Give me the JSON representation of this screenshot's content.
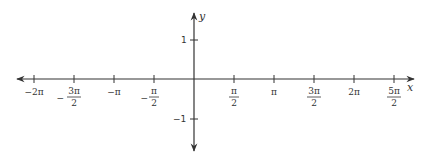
{
  "diagram": {
    "type": "coordinate-axes",
    "colors": {
      "axis": "#333333",
      "text": "#333333",
      "background": "#ffffff"
    },
    "x_axis": {
      "name": "x",
      "ticks": [
        {
          "value": "-2pi",
          "sign": "−",
          "num": "2π",
          "den": ""
        },
        {
          "value": "-3pi/2",
          "sign": "−",
          "num": "3π",
          "den": "2"
        },
        {
          "value": "-pi",
          "sign": "−",
          "num": "π",
          "den": ""
        },
        {
          "value": "-pi/2",
          "sign": "−",
          "num": "π",
          "den": "2"
        },
        {
          "value": "pi/2",
          "sign": "",
          "num": "π",
          "den": "2"
        },
        {
          "value": "pi",
          "sign": "",
          "num": "π",
          "den": ""
        },
        {
          "value": "3pi/2",
          "sign": "",
          "num": "3π",
          "den": "2"
        },
        {
          "value": "2pi",
          "sign": "",
          "num": "2π",
          "den": ""
        },
        {
          "value": "5pi/2",
          "sign": "",
          "num": "5π",
          "den": "2"
        }
      ]
    },
    "y_axis": {
      "name": "y",
      "ticks": [
        {
          "value": 1,
          "label": "1"
        },
        {
          "value": -1,
          "label": "−1"
        }
      ]
    },
    "labels": {
      "x_name": "x",
      "y_name": "y",
      "t_m2pi": "−2π",
      "t_m3pi2_sign": "−",
      "t_m3pi2_num": "3π",
      "t_m3pi2_den": "2",
      "t_mpi": "−π",
      "t_mpi2_sign": "−",
      "t_mpi2_num": "π",
      "t_mpi2_den": "2",
      "t_pi2_num": "π",
      "t_pi2_den": "2",
      "t_pi": "π",
      "t_3pi2_num": "3π",
      "t_3pi2_den": "2",
      "t_2pi": "2π",
      "t_5pi2_num": "5π",
      "t_5pi2_den": "2",
      "y_1": "1",
      "y_m1": "−1"
    }
  }
}
